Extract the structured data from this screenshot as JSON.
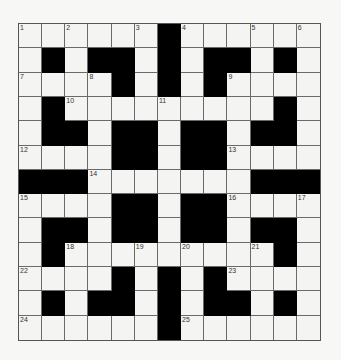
{
  "puzzle": {
    "rows": 13,
    "cols": 13,
    "colors": {
      "block": "#000000",
      "cell": "#f4f4f2",
      "line": "#6a6a6a"
    },
    "pattern": [
      "WWWWWWBWWWWWW",
      "WBWBBWBWBBWBW",
      "WWWWBWBWBWWWW",
      "WBWWWWWWWWWBW",
      "WBBWBBWBBWBBW",
      "WWWWBBWBBWWWW",
      "BBBWWWWWWWBBB",
      "WWWWBBWBBWWWW",
      "WBBWBBWBBWBBW",
      "WBWWWWWWWWWBW",
      "WWWWBWBWBWWWW",
      "WBWBBWBWBBWBW",
      "WWWWWWBWWWWWW"
    ],
    "numbers": [
      {
        "r": 0,
        "c": 0,
        "n": "1"
      },
      {
        "r": 0,
        "c": 2,
        "n": "2"
      },
      {
        "r": 0,
        "c": 5,
        "n": "3"
      },
      {
        "r": 0,
        "c": 7,
        "n": "4"
      },
      {
        "r": 0,
        "c": 10,
        "n": "5"
      },
      {
        "r": 0,
        "c": 12,
        "n": "6"
      },
      {
        "r": 2,
        "c": 0,
        "n": "7"
      },
      {
        "r": 2,
        "c": 3,
        "n": "8"
      },
      {
        "r": 2,
        "c": 9,
        "n": "9"
      },
      {
        "r": 3,
        "c": 2,
        "n": "10"
      },
      {
        "r": 3,
        "c": 6,
        "n": "11"
      },
      {
        "r": 5,
        "c": 0,
        "n": "12"
      },
      {
        "r": 5,
        "c": 9,
        "n": "13"
      },
      {
        "r": 6,
        "c": 3,
        "n": "14"
      },
      {
        "r": 7,
        "c": 0,
        "n": "15"
      },
      {
        "r": 7,
        "c": 9,
        "n": "16"
      },
      {
        "r": 7,
        "c": 12,
        "n": "17"
      },
      {
        "r": 9,
        "c": 2,
        "n": "18"
      },
      {
        "r": 9,
        "c": 5,
        "n": "19"
      },
      {
        "r": 9,
        "c": 7,
        "n": "20"
      },
      {
        "r": 9,
        "c": 10,
        "n": "21"
      },
      {
        "r": 10,
        "c": 0,
        "n": "22"
      },
      {
        "r": 10,
        "c": 9,
        "n": "23"
      },
      {
        "r": 12,
        "c": 0,
        "n": "24"
      },
      {
        "r": 12,
        "c": 7,
        "n": "25"
      }
    ]
  }
}
